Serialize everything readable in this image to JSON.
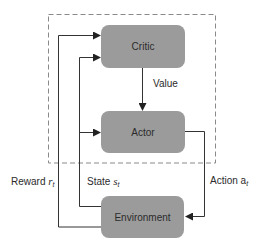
{
  "diagram": {
    "type": "actor-critic reinforcement learning loop",
    "colors": {
      "node_fill": "#9b9b9b",
      "line": "#333333",
      "dashed_border": "#8a8a8a",
      "text": "#2b2b2b"
    },
    "agent_boundary": {
      "style": "dashed",
      "contains": [
        "critic",
        "actor"
      ]
    },
    "nodes": {
      "critic": {
        "label": "Critic"
      },
      "actor": {
        "label": "Actor"
      },
      "environment": {
        "label": "Environment"
      }
    },
    "edges": {
      "value": {
        "from": "critic",
        "to": "actor",
        "label": "Value"
      },
      "action": {
        "from": "actor",
        "to": "environment",
        "label_main": "Action a",
        "label_sub": "t"
      },
      "state": {
        "from": "environment",
        "to": [
          "critic",
          "actor"
        ],
        "label_main": "State ",
        "label_var": "s",
        "label_sub": "t"
      },
      "reward": {
        "from": "environment",
        "to": "critic",
        "label_main": "Reward ",
        "label_var": "r",
        "label_sub": "t"
      }
    }
  }
}
